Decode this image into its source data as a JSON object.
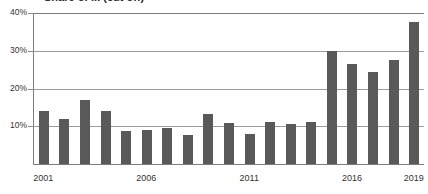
{
  "title": {
    "text": "Share of ... (cut off)",
    "visible_fragment": true
  },
  "chart_data": {
    "type": "bar",
    "title": "",
    "xlabel": "",
    "ylabel": "",
    "ylim": [
      0,
      40
    ],
    "grid": true,
    "legend": null,
    "bar_color": "#595959",
    "gridline_color": "#9b9b9b",
    "axis_color": "#7d7d7d",
    "y_ticks": [
      10,
      20,
      30,
      40
    ],
    "y_tick_labels": [
      "10%",
      "20%",
      "30%",
      "40%"
    ],
    "x_tick_labels": [
      "2001",
      "2006",
      "2011",
      "2016",
      "2019"
    ],
    "x_tick_categories": [
      "2001",
      "2006",
      "2011",
      "2016",
      "2019"
    ],
    "categories": [
      "2001",
      "2002",
      "2003",
      "2004",
      "2005",
      "2006",
      "2007",
      "2008",
      "2009",
      "2010",
      "2011",
      "2012",
      "2013",
      "2014",
      "2015",
      "2016",
      "2017",
      "2018",
      "2019"
    ],
    "values": [
      14.0,
      12.0,
      17.0,
      14.0,
      8.8,
      9.0,
      9.6,
      7.8,
      13.3,
      10.8,
      8.0,
      11.0,
      10.5,
      11.0,
      30.0,
      26.5,
      24.5,
      27.5,
      37.5
    ],
    "value_labels": [
      "14%",
      "12%",
      "17%",
      "14%",
      "8.8%",
      "9%",
      "9.6%",
      "7.8%",
      "13.3%",
      "10.8%",
      "8%",
      "11%",
      "10.5%",
      "11%",
      "30%",
      "26.5%",
      "24.5%",
      "27.5%",
      "37.5%"
    ]
  }
}
